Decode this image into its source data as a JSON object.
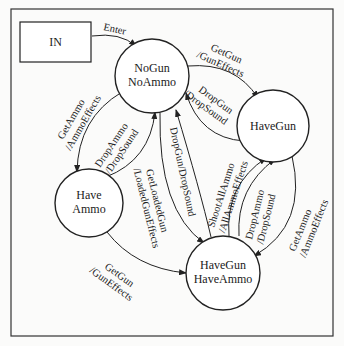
{
  "diagram": {
    "type": "state-machine",
    "entry": {
      "label": "IN"
    },
    "states": [
      {
        "id": "nogun_noammo",
        "line1": "NoGun",
        "line2": "NoAmmo"
      },
      {
        "id": "havegun",
        "line1": "HaveGun",
        "line2": ""
      },
      {
        "id": "haveammo",
        "line1": "Have",
        "line2": "Ammo"
      },
      {
        "id": "havegun_haveammo",
        "line1": "HaveGun",
        "line2": "HaveAmmo"
      }
    ],
    "transitions": [
      {
        "from": "IN",
        "to": "nogun_noammo",
        "line1": "Enter",
        "line2": ""
      },
      {
        "from": "nogun_noammo",
        "to": "havegun",
        "line1": "GetGun",
        "line2": "/GunEffects"
      },
      {
        "from": "havegun",
        "to": "nogun_noammo",
        "line1": "DropGun",
        "line2": "/DropSound"
      },
      {
        "from": "nogun_noammo",
        "to": "haveammo",
        "line1": "GetAmmo",
        "line2": "/AmmoEffects"
      },
      {
        "from": "haveammo",
        "to": "nogun_noammo",
        "line1": "DropAmmo",
        "line2": "/DropSound"
      },
      {
        "from": "nogun_noammo",
        "to": "havegun_haveammo",
        "line1": "GetLoadedGun",
        "line2": "/LoadedGunEffects"
      },
      {
        "from": "havegun_haveammo",
        "to": "nogun_noammo",
        "line1": "DropGun/DropSound",
        "line2": ""
      },
      {
        "from": "haveammo",
        "to": "havegun_haveammo",
        "line1": "GetGun",
        "line2": "/GunEffects"
      },
      {
        "from": "havegun_haveammo",
        "to": "havegun",
        "line1": "ShootAllAmmo",
        "line2": "/AllAmmoEffects"
      },
      {
        "from": "havegun_haveammo",
        "to": "havegun",
        "line1": "DropAmmo",
        "line2": "/DropSound"
      },
      {
        "from": "havegun",
        "to": "havegun_haveammo",
        "line1": "GetAmmo",
        "line2": "/AmmoEffects"
      }
    ]
  }
}
